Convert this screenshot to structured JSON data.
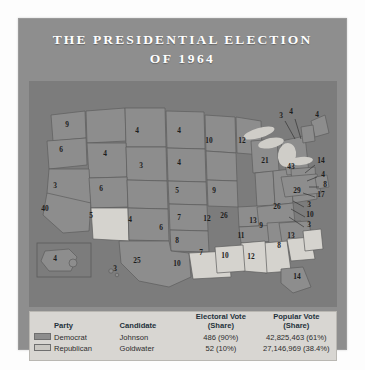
{
  "title": {
    "line1": "THE PRESIDENTIAL ELECTION",
    "line2": "OF 1964"
  },
  "colors": {
    "panel_background": "#8e8e8e",
    "map_background": "#8a8a8a",
    "democrat_fill": "#8d8d8d",
    "republican_fill": "#d5d3ce",
    "ocean": "#7c7c7c",
    "legend_background": "#d8d6d2",
    "title_text": "#ffffff",
    "label_text": "#1d1d1d"
  },
  "legend": {
    "headers": {
      "party": "Party",
      "candidate": "Candidate",
      "electoral_vote_l1": "Electoral Vote",
      "electoral_vote_l2": "(Share)",
      "popular_vote_l1": "Popular Vote",
      "popular_vote_l2": "(Share)"
    },
    "rows": [
      {
        "swatch": "democrat-swatch",
        "party": "Democrat",
        "candidate": "Johnson",
        "electoral_vote": "486 (90%)",
        "popular_vote": "42,825,463 (61%)"
      },
      {
        "swatch": "republican-swatch",
        "party": "Republican",
        "candidate": "Goldwater",
        "electoral_vote": "52 (10%)",
        "popular_vote": "27,146,969 (38.4%)"
      }
    ]
  },
  "chart_data": {
    "type": "map",
    "title": "The Presidential Election of 1964",
    "subtitle": "Electoral votes by state",
    "legend_position": "bottom",
    "series": [
      {
        "name": "Democrat",
        "candidate": "Johnson",
        "electoral_votes": 486,
        "electoral_share": "90%",
        "popular_votes": 42825463,
        "popular_share": "61%",
        "color": "#8d8d8d"
      },
      {
        "name": "Republican",
        "candidate": "Goldwater",
        "electoral_votes": 52,
        "electoral_share": "10%",
        "popular_votes": 27146969,
        "popular_share": "38.4%",
        "color": "#d5d3ce"
      }
    ],
    "states": [
      {
        "label": "9",
        "party": "Democrat",
        "x": 38,
        "y": 44
      },
      {
        "label": "6",
        "party": "Democrat",
        "x": 32,
        "y": 69
      },
      {
        "label": "4",
        "party": "Democrat",
        "x": 76,
        "y": 73
      },
      {
        "label": "4",
        "party": "Democrat",
        "x": 108,
        "y": 50
      },
      {
        "label": "4",
        "party": "Democrat",
        "x": 150,
        "y": 50
      },
      {
        "label": "10",
        "party": "Democrat",
        "x": 180,
        "y": 60
      },
      {
        "label": "3",
        "party": "Democrat",
        "x": 112,
        "y": 85
      },
      {
        "label": "4",
        "party": "Democrat",
        "x": 150,
        "y": 82
      },
      {
        "label": "3",
        "party": "Democrat",
        "x": 26,
        "y": 105
      },
      {
        "label": "40",
        "party": "Democrat",
        "x": 16,
        "y": 128
      },
      {
        "label": "6",
        "party": "Democrat",
        "x": 72,
        "y": 108
      },
      {
        "label": "5",
        "party": "Republican",
        "x": 62,
        "y": 135
      },
      {
        "label": "4",
        "party": "Democrat",
        "x": 101,
        "y": 139
      },
      {
        "label": "5",
        "party": "Democrat",
        "x": 148,
        "y": 110
      },
      {
        "label": "9",
        "party": "Democrat",
        "x": 185,
        "y": 110
      },
      {
        "label": "12",
        "party": "Democrat",
        "x": 213,
        "y": 60
      },
      {
        "label": "21",
        "party": "Democrat",
        "x": 236,
        "y": 80
      },
      {
        "label": "26",
        "party": "Democrat",
        "x": 195,
        "y": 135
      },
      {
        "label": "13",
        "party": "Democrat",
        "x": 224,
        "y": 140
      },
      {
        "label": "26",
        "party": "Democrat",
        "x": 248,
        "y": 126
      },
      {
        "label": "29",
        "party": "Democrat",
        "x": 268,
        "y": 110
      },
      {
        "label": "43",
        "party": "Democrat",
        "x": 262,
        "y": 86
      },
      {
        "label": "6",
        "party": "Democrat",
        "x": 132,
        "y": 147
      },
      {
        "label": "7",
        "party": "Democrat",
        "x": 150,
        "y": 137
      },
      {
        "label": "12",
        "party": "Democrat",
        "x": 178,
        "y": 138
      },
      {
        "label": "11",
        "party": "Democrat",
        "x": 212,
        "y": 155
      },
      {
        "label": "9",
        "party": "Democrat",
        "x": 232,
        "y": 145
      },
      {
        "label": "13",
        "party": "Democrat",
        "x": 262,
        "y": 155
      },
      {
        "label": "8",
        "party": "Democrat",
        "x": 148,
        "y": 160
      },
      {
        "label": "25",
        "party": "Democrat",
        "x": 108,
        "y": 180
      },
      {
        "label": "10",
        "party": "Republican",
        "x": 148,
        "y": 183
      },
      {
        "label": "7",
        "party": "Republican",
        "x": 172,
        "y": 172
      },
      {
        "label": "10",
        "party": "Republican",
        "x": 196,
        "y": 175
      },
      {
        "label": "12",
        "party": "Republican",
        "x": 222,
        "y": 176
      },
      {
        "label": "8",
        "party": "Republican",
        "x": 250,
        "y": 165
      },
      {
        "label": "14",
        "party": "Democrat",
        "x": 268,
        "y": 196
      },
      {
        "label": "3",
        "party": "Democrat",
        "x": 252,
        "y": 35
      },
      {
        "label": "4",
        "party": "Democrat",
        "x": 262,
        "y": 31
      },
      {
        "label": "4",
        "party": "Democrat",
        "x": 288,
        "y": 34
      },
      {
        "label": "14",
        "party": "Democrat",
        "x": 292,
        "y": 80
      },
      {
        "label": "4",
        "party": "Democrat",
        "x": 294,
        "y": 94
      },
      {
        "label": "8",
        "party": "Democrat",
        "x": 296,
        "y": 104
      },
      {
        "label": "17",
        "party": "Democrat",
        "x": 292,
        "y": 114
      },
      {
        "label": "3",
        "party": "Democrat",
        "x": 280,
        "y": 124
      },
      {
        "label": "10",
        "party": "Democrat",
        "x": 281,
        "y": 134
      },
      {
        "label": "3",
        "party": "Democrat",
        "x": 280,
        "y": 144
      },
      {
        "label": "4",
        "party": "Democrat",
        "x": 26,
        "y": 178
      },
      {
        "label": "3",
        "party": "Democrat",
        "x": 86,
        "y": 188
      }
    ]
  }
}
